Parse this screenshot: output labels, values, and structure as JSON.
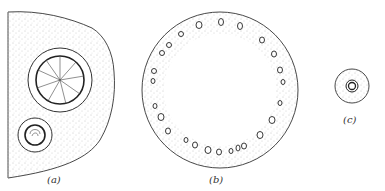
{
  "figure": {
    "panels": [
      {
        "id": "a",
        "label": "(a)",
        "description": "section with large and small vascular bundles in ground tissue"
      },
      {
        "id": "b",
        "label": "(b)",
        "description": "ring of scattered bundles around a hollow centre"
      },
      {
        "id": "c",
        "label": "(c)",
        "description": "small section with single central bundle"
      }
    ],
    "colors": {
      "line": "#333333",
      "stipple": "#8a8a8a",
      "background": "#ffffff"
    }
  }
}
